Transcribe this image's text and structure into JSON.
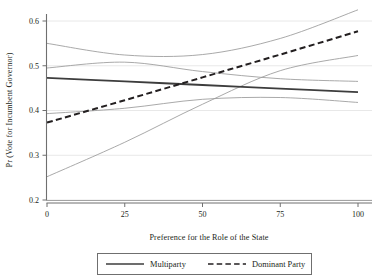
{
  "chart_data": {
    "type": "line",
    "title": "",
    "xlabel": "Preference for the Role of the State",
    "ylabel": "Pr (Vote for Incumbent Governor)",
    "xlim": [
      0,
      100
    ],
    "ylim": [
      0.2,
      0.63
    ],
    "xticks": [
      0,
      25,
      50,
      75,
      100
    ],
    "xtick_labels": [
      "0",
      "25",
      "50",
      "75",
      "100"
    ],
    "yticks": [
      0.2,
      0.3,
      0.4,
      0.5,
      0.6
    ],
    "ytick_labels": [
      "0.2",
      "0.3",
      "0.4",
      "0.5",
      "0.6"
    ],
    "grid": "horizontal",
    "legend_position": "bottom-center",
    "series": [
      {
        "name": "Multiparty",
        "style": "solid",
        "color": "#3d3d3d",
        "x": [
          0,
          25,
          50,
          75,
          100
        ],
        "values": [
          0.473,
          0.465,
          0.457,
          0.449,
          0.441
        ],
        "ci_upper": [
          0.495,
          0.508,
          0.487,
          0.471,
          0.465
        ],
        "ci_lower": [
          0.393,
          0.405,
          0.425,
          0.429,
          0.418
        ]
      },
      {
        "name": "Dominant Party",
        "style": "dashed",
        "color": "#231f20",
        "x": [
          0,
          25,
          50,
          75,
          100
        ],
        "values": [
          0.373,
          0.423,
          0.474,
          0.525,
          0.577
        ],
        "ci_upper": [
          0.55,
          0.524,
          0.525,
          0.561,
          0.625
        ],
        "ci_lower": [
          0.252,
          0.329,
          0.414,
          0.489,
          0.523
        ]
      }
    ],
    "ci_color": "#9a9a9a",
    "grid_color": "#e8e8e8",
    "axis_color": "#6f6f6f"
  },
  "legend": {
    "items": [
      {
        "label": "Multiparty",
        "style": "solid"
      },
      {
        "label": "Dominant Party",
        "style": "dashed"
      }
    ]
  }
}
